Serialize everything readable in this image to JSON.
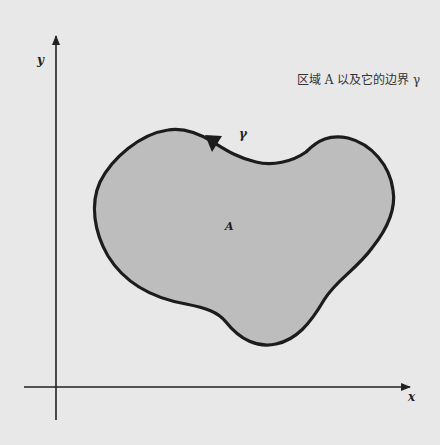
{
  "title": "区域 A 以及它的边界 γ",
  "axes": {
    "x_label": "x",
    "y_label": "y"
  },
  "region": {
    "label": "A",
    "fill_color": "#bdbdbd",
    "boundary_color": "#1a1a1a"
  },
  "boundary": {
    "label": "γ",
    "orientation": "counterclockwise"
  },
  "colors": {
    "background": "#e8e8e8",
    "axis": "#222222"
  }
}
